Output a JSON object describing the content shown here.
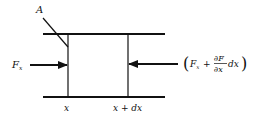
{
  "diagram": {
    "type": "free-body element",
    "labels": {
      "area": "A",
      "left_force": "F",
      "left_force_sub": "x",
      "left_position": "x",
      "right_position": "x + dx"
    },
    "right_force_expression": {
      "open_paren": "(",
      "close_paren": ")",
      "base": "F",
      "base_sub": "x",
      "plus": "+",
      "numerator": "∂F",
      "denominator": "∂x",
      "differential": "dx"
    },
    "colors": {
      "stroke": "#111111",
      "background": "#ffffff"
    }
  }
}
